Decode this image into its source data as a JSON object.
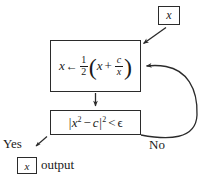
{
  "diagram": {
    "background_color": "#ffffff",
    "line_color": "#2b2b2b",
    "text_color": "#1a1a1a"
  },
  "nodes": {
    "input": {
      "name": "input-x-box",
      "variable": "x"
    },
    "update": {
      "name": "update-formula-box",
      "formula_text": "x ← 1/2 ( x + c/x )",
      "assign_var": "x",
      "arrow": "←",
      "coefficient_numerator": "1",
      "coefficient_denominator": "2",
      "open_paren": "(",
      "inner_first": "x",
      "inner_op": "+",
      "frac_numerator": "c",
      "frac_denominator": "x",
      "close_paren": ")"
    },
    "condition": {
      "name": "condition-box",
      "condition_text": "|x² − c|² < ϵ",
      "abs_open": "|",
      "base": "x",
      "base_exponent": "2",
      "minus": "−",
      "const": "c",
      "abs_close": "|",
      "outer_exponent": "2",
      "relation": "<",
      "epsilon": "ϵ"
    },
    "output": {
      "name": "output-x-box",
      "variable": "x",
      "word": "output"
    }
  },
  "labels": {
    "yes": "Yes",
    "no": "No"
  },
  "edges": [
    {
      "name": "input-to-update-arrow",
      "from": "input-x-box",
      "to": "update-formula-box",
      "style": "diagonal-arrow-down-left"
    },
    {
      "name": "update-to-condition-arrow",
      "from": "update-formula-box",
      "to": "condition-box",
      "style": "vertical-arrow-down"
    },
    {
      "name": "condition-no-loop-arrow",
      "from": "condition-box",
      "to": "update-formula-box",
      "style": "curved-feedback-loop-right",
      "label": "No"
    },
    {
      "name": "condition-yes-arrow",
      "from": "condition-box",
      "to": "output-x-box",
      "style": "diagonal-arrow-down-left",
      "label": "Yes"
    }
  ]
}
